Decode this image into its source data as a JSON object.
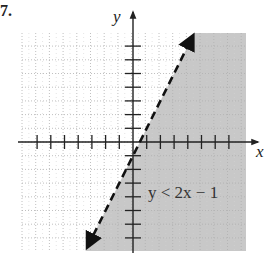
{
  "problem": {
    "number": "7."
  },
  "chart_data": {
    "type": "line",
    "title": "",
    "inequality": "y < 2x − 1",
    "boundary_line": {
      "equation": "y = 2x - 1",
      "slope": 2,
      "intercept": -1,
      "style": "dashed",
      "arrows": "both ends"
    },
    "shaded_region": "below/right of line (y < 2x - 1)",
    "xlabel": "x",
    "ylabel": "y",
    "xlim": [
      -8,
      8
    ],
    "ylim": [
      -8,
      8
    ],
    "x_ticks": [
      -7,
      -6,
      -5,
      -4,
      -3,
      -2,
      -1,
      1,
      2,
      3,
      4,
      5,
      6,
      7
    ],
    "y_ticks": [
      -7,
      -6,
      -5,
      -4,
      -3,
      -2,
      -1,
      1,
      2,
      3,
      4,
      5,
      6,
      7
    ],
    "tick_labels_shown": false,
    "grid": true,
    "grid_style": "dotted",
    "label_position": {
      "x": 1,
      "y": -4
    },
    "colors": {
      "shade": "#c8c8c8",
      "line": "#111111",
      "grid": "#b0b0b0",
      "axis": "#222222"
    }
  }
}
